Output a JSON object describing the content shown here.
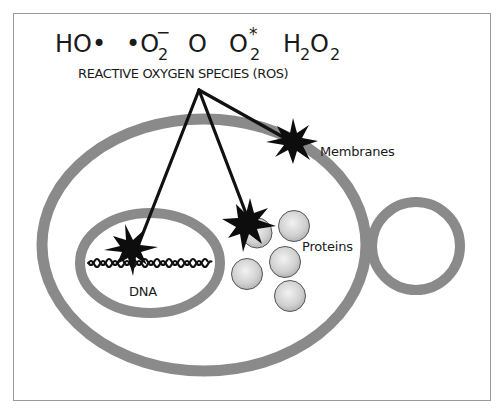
{
  "figure": {
    "title": "REACTIVE OXYGEN SPECIES (ROS)",
    "formulas": [
      {
        "id": "hydroxyl-radical",
        "main": "HO•",
        "sub": "",
        "sup": ""
      },
      {
        "id": "superoxide",
        "main": "•O",
        "sub": "2",
        "sup": "−"
      },
      {
        "id": "atomic-oxygen",
        "main": "O",
        "sub": "",
        "sup": ""
      },
      {
        "id": "singlet-oxygen",
        "main": "O",
        "sub": "2",
        "sup": "*"
      },
      {
        "id": "hydrogen-peroxide",
        "main_h": "H",
        "sub_h": "2",
        "main_o": "O",
        "sub_o": "2"
      }
    ],
    "targets": {
      "membranes": "Membranes",
      "proteins": "Proteins",
      "dna": "DNA"
    },
    "colors": {
      "membrane_gray": "#8a8a8a",
      "arrow_black": "#111111",
      "protein_fill": "#d4d4d4",
      "frame": "#9a9a9a"
    }
  }
}
